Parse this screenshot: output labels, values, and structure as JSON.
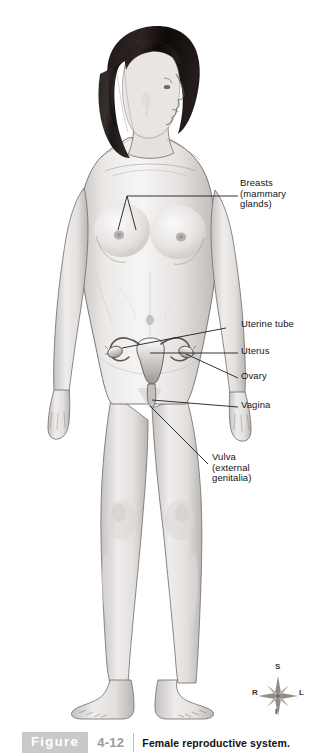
{
  "page": {
    "cut_off_text_top": "",
    "background_color": "#ffffff"
  },
  "figure": {
    "label_word": "Figure",
    "number": "4-12",
    "caption": "Female reproductive system.",
    "box_color": "#c9c9c9",
    "number_color": "#9a9a9a",
    "caption_color": "#111111"
  },
  "illustration": {
    "subject": "female-body-anterior-view",
    "style": "grayscale-medical-illustration",
    "hair_color": "#14100f",
    "skin_color": "#e9e7e5",
    "outline_color": "#5d5a58"
  },
  "labels": [
    {
      "id": "breasts",
      "text": "Breasts\n(mammary\nglands)",
      "x": 240,
      "y": 175
    },
    {
      "id": "uterine-tube",
      "text": "Uterine tube",
      "x": 241,
      "y": 316
    },
    {
      "id": "uterus",
      "text": "Uterus",
      "x": 241,
      "y": 343
    },
    {
      "id": "ovary",
      "text": "Ovary",
      "x": 241,
      "y": 368
    },
    {
      "id": "vagina",
      "text": "Vagina",
      "x": 241,
      "y": 397
    },
    {
      "id": "vulva",
      "text": "Vulva\n(external\ngenitalia)",
      "x": 212,
      "y": 450
    }
  ],
  "compass": {
    "name": "anatomical-orientation-rose",
    "superior": "S",
    "inferior": "I",
    "right": "R",
    "left": "L"
  }
}
